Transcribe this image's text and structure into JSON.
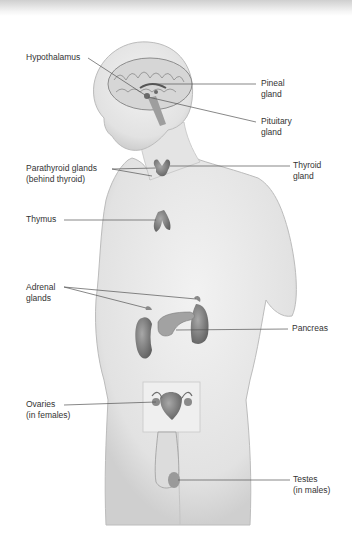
{
  "diagram": {
    "labels": {
      "hypothalamus": [
        "Hypothalamus"
      ],
      "pineal": [
        "Pineal",
        "gland"
      ],
      "pituitary": [
        "Pituitary",
        "gland"
      ],
      "parathyroid": [
        "Parathyroid glands",
        "(behind thyroid)"
      ],
      "thyroid": [
        "Thyroid",
        "gland"
      ],
      "thymus": [
        "Thymus"
      ],
      "adrenal": [
        "Adrenal",
        "glands"
      ],
      "pancreas": [
        "Pancreas"
      ],
      "ovaries": [
        "Ovaries",
        "(in females)"
      ],
      "testes": [
        "Testes",
        "(in males)"
      ]
    }
  }
}
